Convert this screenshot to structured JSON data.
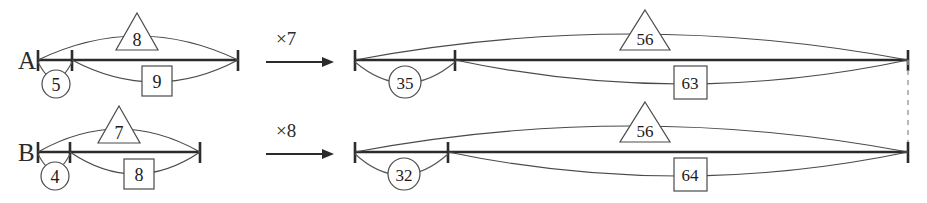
{
  "figure": {
    "background_color": "#ffffff",
    "line_color": "#2b2b2b",
    "arc_color": "#4a4a4a",
    "dashed_color": "#9a9a9a"
  },
  "rows": [
    {
      "label": "A",
      "operator": "×7",
      "left": {
        "circle": "5",
        "triangle": "8",
        "square": "9"
      },
      "right": {
        "circle": "35",
        "triangle": "56",
        "square": "63"
      }
    },
    {
      "label": "B",
      "operator": "×8",
      "left": {
        "circle": "4",
        "triangle": "7",
        "square": "8"
      },
      "right": {
        "circle": "32",
        "triangle": "56",
        "square": "64"
      }
    }
  ],
  "icons": {
    "circle": "circle-badge",
    "triangle": "triangle-badge",
    "square": "square-badge",
    "arrow": "right-arrow-icon",
    "tick": "tick-mark",
    "dashed": "dashed-connector"
  }
}
